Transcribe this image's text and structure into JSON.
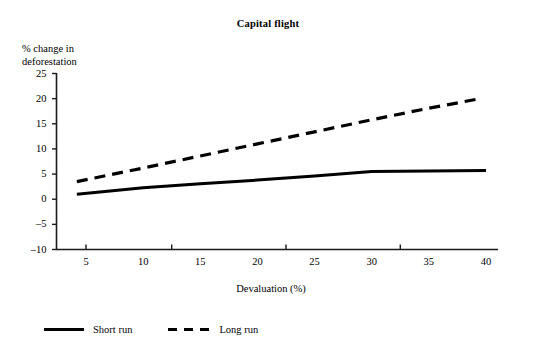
{
  "chart_data": {
    "type": "line",
    "title": "Capital flight",
    "xlabel": "Devaluation (%)",
    "ylabel_line1": "% change in",
    "ylabel_line2": "deforestation",
    "xlim": [
      3,
      41
    ],
    "ylim": [
      -10,
      25
    ],
    "xticks": [
      5,
      10,
      15,
      20,
      25,
      30,
      35,
      40
    ],
    "xtick_labels": [
      "5",
      "10",
      "15",
      "20",
      "25",
      "30",
      "35",
      "40"
    ],
    "yticks": [
      25,
      20,
      15,
      10,
      5,
      0,
      -5,
      -10
    ],
    "ytick_labels": [
      "25",
      "20",
      "15",
      "10",
      "5",
      "0",
      "–5",
      "–10"
    ],
    "grid": false,
    "legend_position": "below-plot",
    "series": [
      {
        "name": "Short run",
        "style": "solid",
        "color": "#000000",
        "x": [
          4.2,
          10,
          15,
          20,
          25,
          30,
          35,
          40
        ],
        "values": [
          1.0,
          2.3,
          3.1,
          3.8,
          4.6,
          5.5,
          5.6,
          5.7
        ]
      },
      {
        "name": "Long run",
        "style": "dashed",
        "color": "#000000",
        "x": [
          4.2,
          10,
          15,
          20,
          25,
          30,
          35,
          39.5
        ],
        "values": [
          3.5,
          6.2,
          8.6,
          11.0,
          13.4,
          15.8,
          18.1,
          20.0
        ]
      }
    ],
    "legend": [
      {
        "label": "Short run",
        "style": "solid",
        "swatch": "solid-line-swatch"
      },
      {
        "label": "Long run",
        "style": "dashed",
        "swatch": "dashed-line-swatch"
      }
    ]
  }
}
